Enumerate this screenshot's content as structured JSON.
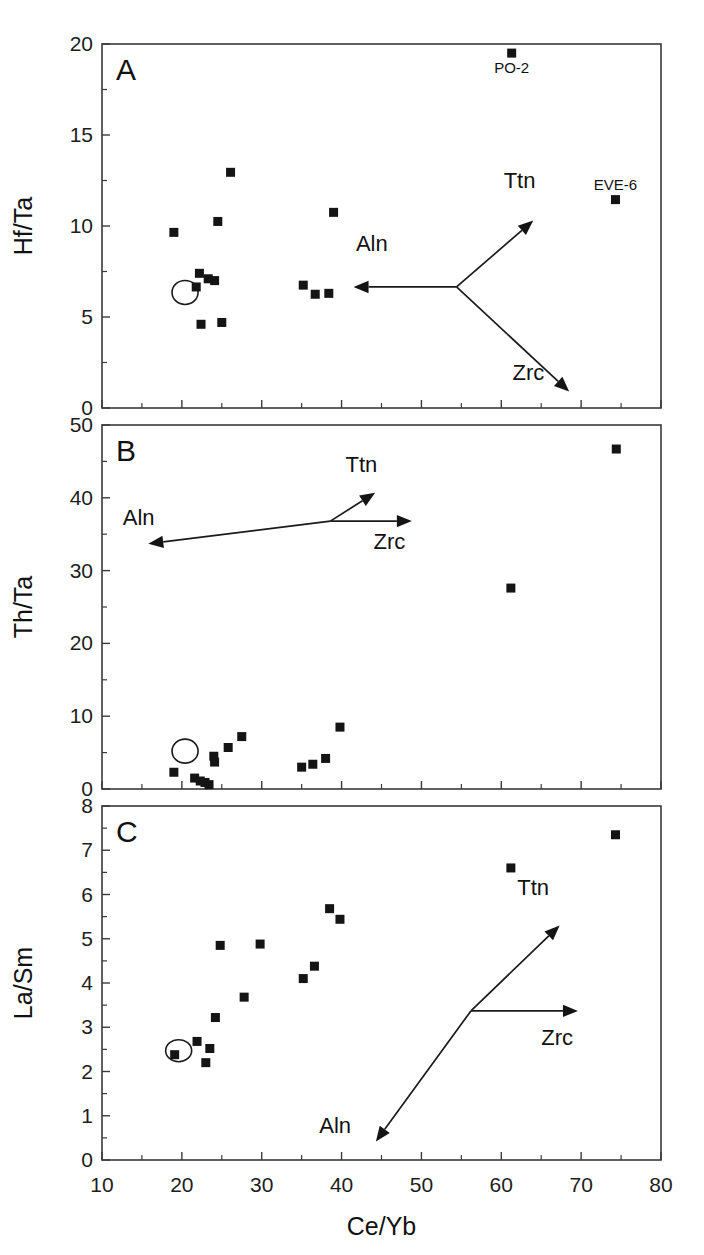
{
  "figure": {
    "xlabel": "Ce/Yb",
    "xlim": [
      10,
      80
    ],
    "xticks": [
      10,
      20,
      30,
      40,
      50,
      60,
      70,
      80
    ],
    "xticklabels": [
      "10",
      "20",
      "30",
      "40",
      "50",
      "60",
      "70",
      "80"
    ]
  },
  "chart_data": [
    {
      "type": "scatter",
      "panel": "A",
      "title": "",
      "xlabel": "Ce/Yb",
      "ylabel": "Hf/Ta",
      "xlim": [
        10,
        80
      ],
      "ylim": [
        0,
        20
      ],
      "xticks": [
        10,
        20,
        30,
        40,
        50,
        60,
        70,
        80
      ],
      "yticks": [
        0,
        5,
        10,
        15,
        20
      ],
      "yticklabels": [
        "0",
        "5",
        "10",
        "15",
        "20"
      ],
      "grid": false,
      "legend": "none",
      "points": [
        {
          "x": 19.0,
          "y": 9.65
        },
        {
          "x": 22.2,
          "y": 7.4
        },
        {
          "x": 23.3,
          "y": 7.1
        },
        {
          "x": 24.1,
          "y": 7.0
        },
        {
          "x": 21.8,
          "y": 6.65
        },
        {
          "x": 22.4,
          "y": 4.6
        },
        {
          "x": 25.0,
          "y": 4.7
        },
        {
          "x": 24.5,
          "y": 10.25
        },
        {
          "x": 26.1,
          "y": 12.95
        },
        {
          "x": 35.2,
          "y": 6.75
        },
        {
          "x": 36.7,
          "y": 6.25
        },
        {
          "x": 38.4,
          "y": 6.3
        },
        {
          "x": 39.0,
          "y": 10.75
        },
        {
          "x": 61.3,
          "y": 19.5,
          "label": "PO-2"
        },
        {
          "x": 74.3,
          "y": 11.45,
          "label": "EVE-6"
        }
      ],
      "highlight_circle": {
        "x": 20.4,
        "y": 6.35,
        "rx": 13,
        "ry": 12
      },
      "vectors": [
        {
          "name": "Aln",
          "from": [
            54.4,
            6.65
          ],
          "to": [
            41.5,
            6.65
          ],
          "label_pos": [
            41.8,
            8.6
          ]
        },
        {
          "name": "Ttn",
          "from": [
            54.4,
            6.65
          ],
          "to": [
            64.0,
            10.3
          ],
          "label_pos": [
            60.3,
            12.1
          ]
        },
        {
          "name": "Zrc",
          "from": [
            54.4,
            6.65
          ],
          "to": [
            68.5,
            0.9
          ],
          "label_pos": [
            61.4,
            1.55
          ]
        }
      ]
    },
    {
      "type": "scatter",
      "panel": "B",
      "title": "",
      "xlabel": "Ce/Yb",
      "ylabel": "Th/Ta",
      "xlim": [
        10,
        80
      ],
      "ylim": [
        0,
        50
      ],
      "xticks": [
        10,
        20,
        30,
        40,
        50,
        60,
        70,
        80
      ],
      "yticks": [
        0,
        10,
        20,
        30,
        40,
        50
      ],
      "yticklabels": [
        "0",
        "10",
        "20",
        "30",
        "40",
        "50"
      ],
      "grid": false,
      "legend": "none",
      "points": [
        {
          "x": 19.0,
          "y": 2.3
        },
        {
          "x": 21.6,
          "y": 1.5
        },
        {
          "x": 22.3,
          "y": 1.1
        },
        {
          "x": 22.9,
          "y": 0.9
        },
        {
          "x": 23.4,
          "y": 0.6
        },
        {
          "x": 24.0,
          "y": 4.5
        },
        {
          "x": 24.1,
          "y": 3.7
        },
        {
          "x": 25.8,
          "y": 5.7
        },
        {
          "x": 27.5,
          "y": 7.2
        },
        {
          "x": 35.0,
          "y": 3.0
        },
        {
          "x": 36.4,
          "y": 3.4
        },
        {
          "x": 38.0,
          "y": 4.2
        },
        {
          "x": 39.8,
          "y": 8.5
        },
        {
          "x": 61.2,
          "y": 27.6
        },
        {
          "x": 74.4,
          "y": 46.7
        }
      ],
      "highlight_circle": {
        "x": 20.4,
        "y": 5.2,
        "rx": 13,
        "ry": 12
      },
      "vectors": [
        {
          "name": "Aln",
          "from": [
            38.6,
            36.8
          ],
          "to": [
            15.8,
            33.7
          ],
          "label_pos": [
            12.6,
            36.3
          ]
        },
        {
          "name": "Ttn",
          "from": [
            38.6,
            36.8
          ],
          "to": [
            44.2,
            40.7
          ],
          "label_pos": [
            40.5,
            43.6
          ]
        },
        {
          "name": "Zrc",
          "from": [
            38.6,
            36.8
          ],
          "to": [
            48.8,
            36.8
          ],
          "label_pos": [
            44.0,
            33.0
          ]
        }
      ]
    },
    {
      "type": "scatter",
      "panel": "C",
      "title": "",
      "xlabel": "Ce/Yb",
      "ylabel": "La/Sm",
      "xlim": [
        10,
        80
      ],
      "ylim": [
        0,
        8
      ],
      "xticks": [
        10,
        20,
        30,
        40,
        50,
        60,
        70,
        80
      ],
      "yticks": [
        0,
        1,
        2,
        3,
        4,
        5,
        6,
        7,
        8
      ],
      "yticklabels": [
        "0",
        "1",
        "2",
        "3",
        "4",
        "5",
        "6",
        "7",
        "8"
      ],
      "grid": false,
      "legend": "none",
      "points": [
        {
          "x": 19.1,
          "y": 2.38
        },
        {
          "x": 21.9,
          "y": 2.68
        },
        {
          "x": 23.0,
          "y": 2.2
        },
        {
          "x": 23.5,
          "y": 2.52
        },
        {
          "x": 24.2,
          "y": 3.22
        },
        {
          "x": 24.8,
          "y": 4.85
        },
        {
          "x": 27.8,
          "y": 3.68
        },
        {
          "x": 29.8,
          "y": 4.88
        },
        {
          "x": 35.2,
          "y": 4.1
        },
        {
          "x": 36.6,
          "y": 4.38
        },
        {
          "x": 38.5,
          "y": 5.68
        },
        {
          "x": 39.8,
          "y": 5.44
        },
        {
          "x": 61.2,
          "y": 6.6
        },
        {
          "x": 74.3,
          "y": 7.35
        }
      ],
      "highlight_circle": {
        "x": 19.6,
        "y": 2.47,
        "rx": 13,
        "ry": 11
      },
      "vectors": [
        {
          "name": "Aln",
          "from": [
            56.2,
            3.37
          ],
          "to": [
            44.3,
            0.42
          ],
          "label_pos": [
            37.2,
            0.62
          ]
        },
        {
          "name": "Ttn",
          "from": [
            56.2,
            3.37
          ],
          "to": [
            67.3,
            5.3
          ],
          "label_pos": [
            62.0,
            6.0
          ]
        },
        {
          "name": "Zrc",
          "from": [
            56.2,
            3.37
          ],
          "to": [
            69.6,
            3.37
          ],
          "label_pos": [
            65.0,
            2.6
          ]
        }
      ]
    }
  ]
}
